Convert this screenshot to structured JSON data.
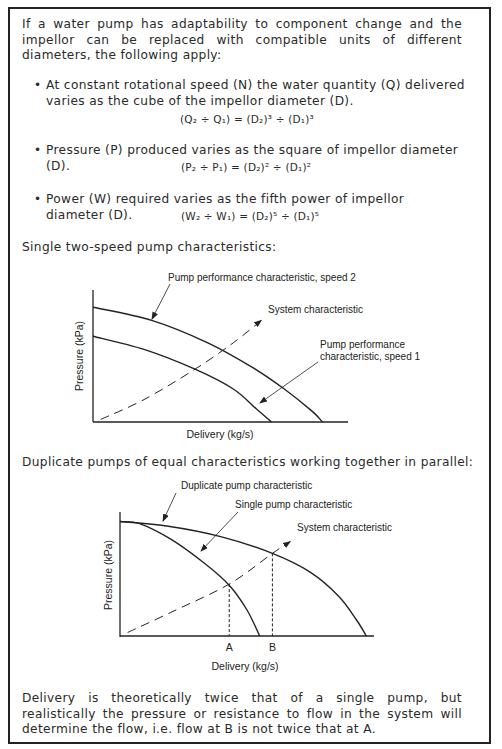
{
  "intro": "If a water pump has adaptability to component change and the impellor can be replaced with compatible units of different diameters, the following apply:",
  "bullets": [
    {
      "text": "At constant rotational speed (N) the water quantity (Q) delivered varies as the cube of the impellor diameter (D).",
      "formula": "(Q₂ ÷ Q₁) = (D₂)³ ÷ (D₁)³"
    },
    {
      "text": "Pressure (P) produced varies as the square of impellor diameter (D).",
      "formula": "(P₂ ÷ P₁) = (D₂)² ÷ (D₁)²"
    },
    {
      "text": "Power (W) required varies as the fifth power of impellor diameter (D).",
      "formula": "(W₂ ÷ W₁) = (D₂)⁵ ÷ (D₁)⁵"
    }
  ],
  "section1_heading": "Single two-speed pump characteristics:",
  "section2_heading": "Duplicate pumps of equal characteristics working together in parallel:",
  "conclusion": "Delivery is theoretically twice that of a single pump, but realistically the pressure or resistance to flow in the system will determine the flow, i.e. flow at B is not twice that at A.",
  "colors": {
    "ink": "#222222",
    "border": "#222222",
    "background": "#ffffff"
  },
  "chart_data": [
    {
      "type": "line",
      "title": "Single two-speed pump characteristics",
      "xlabel": "Delivery (kg/s)",
      "ylabel": "Pressure (kPa)",
      "axis_units": "relative (0-1), no numeric ticks shown",
      "xlim": [
        0,
        1
      ],
      "ylim": [
        0,
        1
      ],
      "grid": false,
      "series": [
        {
          "name": "Pump performance characteristic, speed 2",
          "style": "solid",
          "x": [
            0,
            0.23,
            0.45,
            0.62,
            0.75,
            0.86,
            0.9
          ],
          "y": [
            0.87,
            0.77,
            0.6,
            0.42,
            0.25,
            0.08,
            0
          ]
        },
        {
          "name": "Pump performance characteristic, speed 1",
          "style": "solid",
          "x": [
            0,
            0.2,
            0.4,
            0.55,
            0.64,
            0.7
          ],
          "y": [
            0.65,
            0.55,
            0.4,
            0.25,
            0.1,
            0
          ]
        },
        {
          "name": "System characteristic",
          "style": "dashed",
          "x": [
            0.03,
            0.2,
            0.4,
            0.55,
            0.66
          ],
          "y": [
            0.02,
            0.17,
            0.4,
            0.6,
            0.77
          ]
        }
      ],
      "annotations": [
        "Pump performance characteristic, speed 2",
        "System characteristic",
        "Pump performance characteristic, speed 1"
      ]
    },
    {
      "type": "line",
      "title": "Duplicate pumps of equal characteristics working together in parallel",
      "xlabel": "Delivery (kg/s)",
      "ylabel": "Pressure (kPa)",
      "axis_units": "relative (0-1), no numeric ticks shown",
      "xlim": [
        0,
        1
      ],
      "ylim": [
        0,
        1
      ],
      "grid": false,
      "x_ticks": [
        {
          "label": "A",
          "x": 0.43
        },
        {
          "label": "B",
          "x": 0.6
        }
      ],
      "series": [
        {
          "name": "Duplicate pump characteristic",
          "style": "solid",
          "x": [
            0,
            0.19,
            0.4,
            0.6,
            0.75,
            0.86,
            0.93,
            0.97
          ],
          "y": [
            0.97,
            0.93,
            0.84,
            0.7,
            0.54,
            0.34,
            0.14,
            0
          ]
        },
        {
          "name": "Single pump characteristic",
          "style": "solid",
          "x": [
            0,
            0.08,
            0.2,
            0.33,
            0.43,
            0.5,
            0.55
          ],
          "y": [
            0.97,
            0.95,
            0.82,
            0.62,
            0.43,
            0.22,
            0
          ]
        },
        {
          "name": "System characteristic",
          "style": "dashed",
          "x": [
            0.03,
            0.2,
            0.43,
            0.6,
            0.67
          ],
          "y": [
            0.03,
            0.2,
            0.44,
            0.7,
            0.8
          ]
        }
      ],
      "annotations": [
        "Duplicate pump characteristic",
        "Single pump characteristic",
        "System characteristic"
      ]
    }
  ]
}
